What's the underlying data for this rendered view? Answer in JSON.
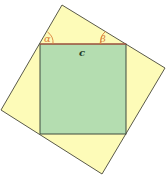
{
  "diagram": {
    "colors": {
      "background": "#ffffff",
      "outer_fill": "#fdfbb8",
      "outer_stroke": "#5a5a4a",
      "inner_fill": "#b4ddb0",
      "inner_stroke": "#3f4a3f",
      "top_edge": "#c8503a",
      "angle_arc": "#d9803a",
      "angle_label": "#d9803a",
      "side_label": "#1e3a28"
    },
    "outer_square": {
      "points": "62,5 165,68 102,174 1,110"
    },
    "inner_square": {
      "x": 40,
      "y": 44,
      "width": 86,
      "height": 90
    },
    "labels": {
      "alpha": "α",
      "beta": "β",
      "side": "c"
    }
  }
}
